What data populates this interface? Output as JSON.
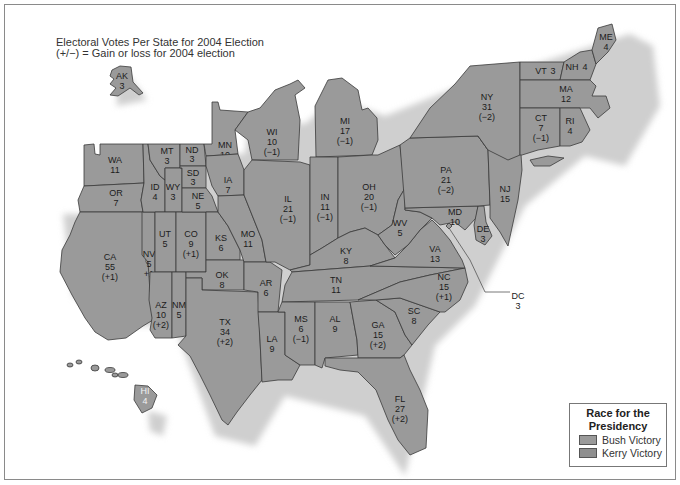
{
  "title": {
    "line1": "Electoral Votes Per State for 2004 Election",
    "line2": "(+/−) = Gain or loss for 2004 election"
  },
  "colors": {
    "state_fill": "#9a9a9a",
    "border": "#3a3a3a",
    "bush": "#9a9a9a",
    "kerry": "#8f8f8f"
  },
  "legend": {
    "title_line1": "Race for the",
    "title_line2": "Presidency",
    "items": [
      {
        "label": "Bush Victory",
        "color": "#9a9a9a"
      },
      {
        "label": "Kerry Victory",
        "color": "#8f8f8f"
      }
    ]
  },
  "states": {
    "AK": {
      "abbr": "AK",
      "votes": "3",
      "change": ""
    },
    "HI": {
      "abbr": "HI",
      "votes": "4",
      "change": ""
    },
    "WA": {
      "abbr": "WA",
      "votes": "11",
      "change": ""
    },
    "OR": {
      "abbr": "OR",
      "votes": "7",
      "change": ""
    },
    "CA": {
      "abbr": "CA",
      "votes": "55",
      "change": "(+1)"
    },
    "ID": {
      "abbr": "ID",
      "votes": "4",
      "change": ""
    },
    "NV": {
      "abbr": "NV",
      "votes": "5",
      "change": "+1"
    },
    "MT": {
      "abbr": "MT",
      "votes": "3",
      "change": ""
    },
    "WY": {
      "abbr": "WY",
      "votes": "3",
      "change": ""
    },
    "UT": {
      "abbr": "UT",
      "votes": "5",
      "change": ""
    },
    "AZ": {
      "abbr": "AZ",
      "votes": "10",
      "change": "(+2)"
    },
    "CO": {
      "abbr": "CO",
      "votes": "9",
      "change": "(+1)"
    },
    "NM": {
      "abbr": "NM",
      "votes": "5",
      "change": ""
    },
    "ND": {
      "abbr": "ND",
      "votes": "3",
      "change": ""
    },
    "SD": {
      "abbr": "SD",
      "votes": "3",
      "change": ""
    },
    "NE": {
      "abbr": "NE",
      "votes": "5",
      "change": ""
    },
    "KS": {
      "abbr": "KS",
      "votes": "6",
      "change": ""
    },
    "OK": {
      "abbr": "OK",
      "votes": "8",
      "change": ""
    },
    "TX": {
      "abbr": "TX",
      "votes": "34",
      "change": "(+2)"
    },
    "MN": {
      "abbr": "MN",
      "votes": "10",
      "change": ""
    },
    "IA": {
      "abbr": "IA",
      "votes": "7",
      "change": ""
    },
    "MO": {
      "abbr": "MO",
      "votes": "11",
      "change": ""
    },
    "AR": {
      "abbr": "AR",
      "votes": "6",
      "change": ""
    },
    "LA": {
      "abbr": "LA",
      "votes": "9",
      "change": ""
    },
    "WI": {
      "abbr": "WI",
      "votes": "10",
      "change": "(−1)"
    },
    "IL": {
      "abbr": "IL",
      "votes": "21",
      "change": "(−1)"
    },
    "MI": {
      "abbr": "MI",
      "votes": "17",
      "change": "(−1)"
    },
    "IN": {
      "abbr": "IN",
      "votes": "11",
      "change": "(−1)"
    },
    "OH": {
      "abbr": "OH",
      "votes": "20",
      "change": "(−1)"
    },
    "KY": {
      "abbr": "KY",
      "votes": "8",
      "change": ""
    },
    "TN": {
      "abbr": "TN",
      "votes": "11",
      "change": ""
    },
    "MS": {
      "abbr": "MS",
      "votes": "6",
      "change": "(−1)"
    },
    "AL": {
      "abbr": "AL",
      "votes": "9",
      "change": ""
    },
    "GA": {
      "abbr": "GA",
      "votes": "15",
      "change": "(+2)"
    },
    "FL": {
      "abbr": "FL",
      "votes": "27",
      "change": "(+2)"
    },
    "SC": {
      "abbr": "SC",
      "votes": "8",
      "change": ""
    },
    "NC": {
      "abbr": "NC",
      "votes": "15",
      "change": "(+1)"
    },
    "VA": {
      "abbr": "VA",
      "votes": "13",
      "change": ""
    },
    "WV": {
      "abbr": "WV",
      "votes": "5",
      "change": ""
    },
    "MD": {
      "abbr": "MD",
      "votes": "10",
      "change": ""
    },
    "DE": {
      "abbr": "DE",
      "votes": "3",
      "change": ""
    },
    "DC": {
      "abbr": "DC",
      "votes": "3",
      "change": ""
    },
    "PA": {
      "abbr": "PA",
      "votes": "21",
      "change": "(−2)"
    },
    "NJ": {
      "abbr": "NJ",
      "votes": "15",
      "change": ""
    },
    "NY": {
      "abbr": "NY",
      "votes": "31",
      "change": "(−2)"
    },
    "CT": {
      "abbr": "CT",
      "votes": "7",
      "change": "(−1)"
    },
    "RI": {
      "abbr": "RI",
      "votes": "4",
      "change": ""
    },
    "MA": {
      "abbr": "MA",
      "votes": "12",
      "change": ""
    },
    "VT": {
      "abbr": "VT",
      "votes": "3",
      "change": ""
    },
    "NH": {
      "abbr": "NH",
      "votes": "4",
      "change": ""
    },
    "ME": {
      "abbr": "ME",
      "votes": "4",
      "change": ""
    }
  }
}
